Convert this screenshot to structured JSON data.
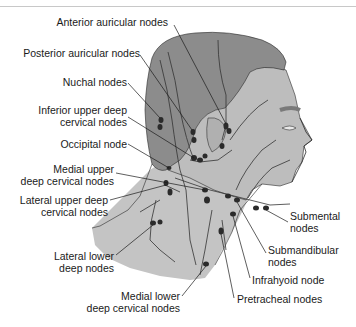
{
  "figure": {
    "colors": {
      "scalp": "#8c8c8c",
      "skin": "#bdbdbd",
      "neck": "#c4c4c4",
      "outline": "#2a2a2a",
      "node": "#2b2b2b",
      "vessel": "#333333"
    },
    "labels": {
      "anterior_auricular": "Anterior auricular nodes",
      "posterior_auricular": "Posterior auricular nodes",
      "nuchal": "Nuchal nodes",
      "inferior_upper_deep_1": "Inferior upper deep",
      "inferior_upper_deep_2": "cervical nodes",
      "occipital": "Occipital node",
      "medial_upper_deep_1": "Medial upper",
      "medial_upper_deep_2": "deep cervical nodes",
      "lateral_upper_deep_1": "Lateral upper deep",
      "lateral_upper_deep_2": "cervical nodes",
      "lateral_lower_deep_1": "Lateral lower",
      "lateral_lower_deep_2": "deep nodes",
      "medial_lower_deep_1": "Medial lower",
      "medial_lower_deep_2": "deep cervical nodes",
      "submental_1": "Submental",
      "submental_2": "nodes",
      "submandibular_1": "Submandibular",
      "submandibular_2": "nodes",
      "infrahyoid": "Infrahyoid node",
      "pretracheal": "Pretracheal nodes"
    }
  }
}
